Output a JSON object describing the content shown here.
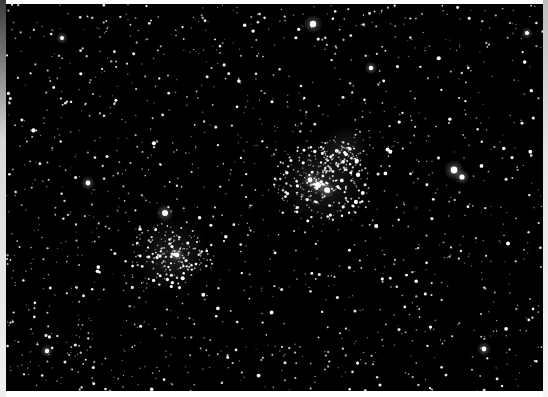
{
  "image": {
    "subject": "star field with double open star cluster",
    "background_color": "#000000",
    "frame_color": "#ffffff",
    "clusters": [
      {
        "name": "cluster-right",
        "cx": 322,
        "cy": 182,
        "r": 48,
        "count": 260
      },
      {
        "name": "cluster-right-upper",
        "cx": 345,
        "cy": 148,
        "r": 25,
        "count": 60
      },
      {
        "name": "cluster-left",
        "cx": 172,
        "cy": 255,
        "r": 42,
        "count": 170
      }
    ],
    "bright_stars": [
      {
        "x": 313,
        "y": 24,
        "r": 3.2
      },
      {
        "x": 454,
        "y": 170,
        "r": 3.4
      },
      {
        "x": 462,
        "y": 177,
        "r": 2.6
      },
      {
        "x": 165,
        "y": 213,
        "r": 3.0
      },
      {
        "x": 88,
        "y": 183,
        "r": 2.4
      },
      {
        "x": 371,
        "y": 68,
        "r": 2.2
      },
      {
        "x": 318,
        "y": 185,
        "r": 3.0
      },
      {
        "x": 327,
        "y": 190,
        "r": 2.8
      },
      {
        "x": 310,
        "y": 180,
        "r": 2.4
      },
      {
        "x": 177,
        "y": 255,
        "r": 2.4
      },
      {
        "x": 484,
        "y": 349,
        "r": 2.4
      },
      {
        "x": 47,
        "y": 351,
        "r": 2.2
      },
      {
        "x": 62,
        "y": 38,
        "r": 2.0
      },
      {
        "x": 527,
        "y": 33,
        "r": 2.0
      }
    ],
    "field_star_count": 1400
  }
}
